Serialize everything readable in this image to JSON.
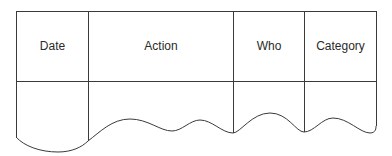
{
  "diagram": {
    "type": "torn-log-table",
    "columns": [
      {
        "label": "Date"
      },
      {
        "label": "Action"
      },
      {
        "label": "Who"
      },
      {
        "label": "Category"
      }
    ],
    "line_color": "#3a3a3a",
    "text_color": "#2a2a2a"
  }
}
